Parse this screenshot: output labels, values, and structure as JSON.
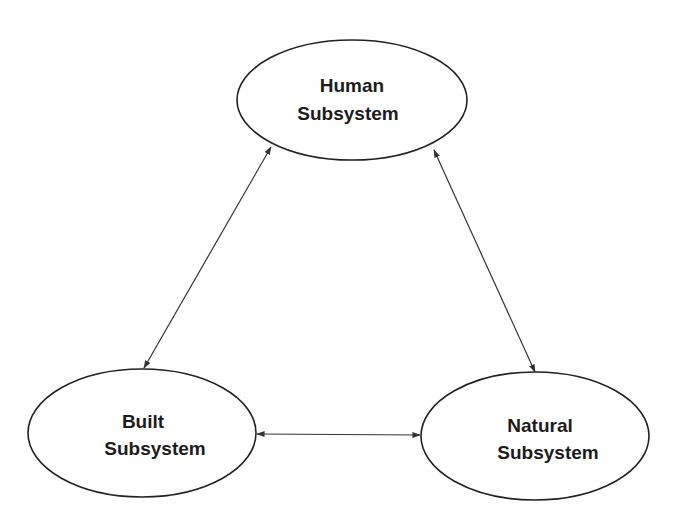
{
  "diagram": {
    "nodes": [
      {
        "id": "human",
        "line1": "Human",
        "line2": "Subsystem",
        "cx": 352,
        "cy": 100,
        "rx": 115,
        "ry": 60
      },
      {
        "id": "built",
        "line1": "Built",
        "line2": "Subsystem",
        "cx": 142,
        "cy": 433,
        "rx": 114,
        "ry": 64
      },
      {
        "id": "natural",
        "line1": "Natural",
        "line2": "Subsystem",
        "cx": 535,
        "cy": 436,
        "rx": 114,
        "ry": 64
      }
    ],
    "edges": [
      {
        "from": "human",
        "to": "built",
        "type": "bidirectional"
      },
      {
        "from": "human",
        "to": "natural",
        "type": "bidirectional"
      },
      {
        "from": "built",
        "to": "natural",
        "type": "bidirectional"
      }
    ],
    "colors": {
      "stroke": "#222222",
      "text": "#1c1c1c",
      "background": "#ffffff"
    }
  }
}
